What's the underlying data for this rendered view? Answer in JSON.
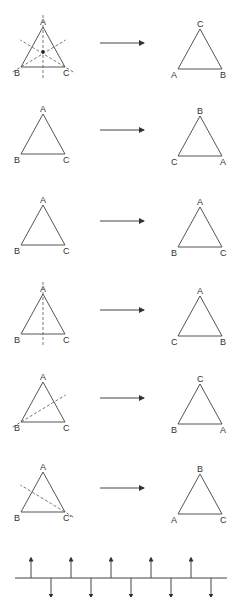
{
  "rows": [
    {
      "name": "rotation-120",
      "left": {
        "top": "A",
        "bottom_left": "B",
        "bottom_right": "C",
        "axes": "all-three-mirror-axes-and-center"
      },
      "right": {
        "top": "C",
        "bottom_left": "A",
        "bottom_right": "B"
      }
    },
    {
      "name": "rotation-240",
      "left": {
        "top": "A",
        "bottom_left": "B",
        "bottom_right": "C",
        "axes": "none"
      },
      "right": {
        "top": "B",
        "bottom_left": "C",
        "bottom_right": "A"
      }
    },
    {
      "name": "identity",
      "left": {
        "top": "A",
        "bottom_left": "B",
        "bottom_right": "C",
        "axes": "none"
      },
      "right": {
        "top": "A",
        "bottom_left": "B",
        "bottom_right": "C"
      }
    },
    {
      "name": "reflection-through-A",
      "left": {
        "top": "A",
        "bottom_left": "B",
        "bottom_right": "C",
        "axes": "vertical-through-A"
      },
      "right": {
        "top": "A",
        "bottom_left": "C",
        "bottom_right": "B"
      }
    },
    {
      "name": "reflection-through-B",
      "left": {
        "top": "A",
        "bottom_left": "B",
        "bottom_right": "C",
        "axes": "through-B"
      },
      "right": {
        "top": "C",
        "bottom_left": "B",
        "bottom_right": "A"
      }
    },
    {
      "name": "reflection-through-C",
      "left": {
        "top": "A",
        "bottom_left": "B",
        "bottom_right": "C'",
        "axes": "through-C"
      },
      "right": {
        "top": "B",
        "bottom_left": "A",
        "bottom_right": "C"
      }
    }
  ],
  "impulse_train": {
    "up_positions": [
      31,
      71,
      111,
      151,
      191
    ],
    "down_positions": [
      51,
      91,
      131,
      171,
      211
    ]
  },
  "colors": {
    "line": "#555555",
    "text": "#333333"
  }
}
